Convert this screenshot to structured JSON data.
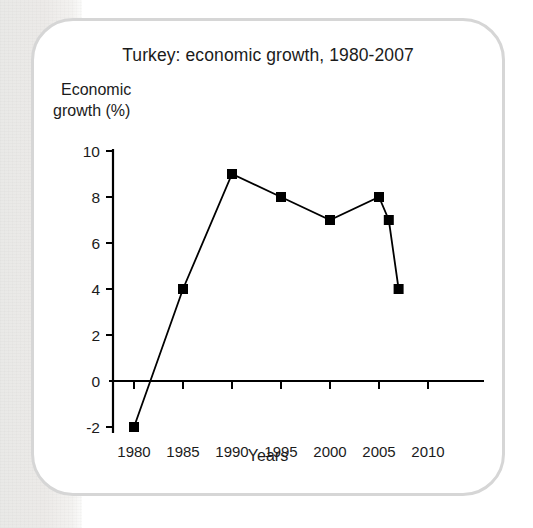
{
  "figure": {
    "title": "Turkey: economic growth, 1980-2007",
    "y_axis_label_line1": "Economic",
    "y_axis_label_line2": "growth (%)",
    "x_axis_label": "Years",
    "card_border_color": "#d6d6d6",
    "series_color": "#000000",
    "background_color": "#ffffff",
    "page_strip_color": "#eceae8"
  },
  "chart_data": {
    "type": "line",
    "title": "Turkey: economic growth, 1980-2007",
    "xlabel": "Years",
    "ylabel": "Economic growth (%)",
    "xlim": [
      1978,
      2011
    ],
    "ylim": [
      -2,
      10
    ],
    "xticks": [
      1980,
      1985,
      1990,
      1995,
      2000,
      2005,
      2010
    ],
    "xtick_labels": [
      "1980",
      "1985",
      "1990",
      "1995",
      "2000",
      "2005",
      "2010"
    ],
    "yticks": [
      -2,
      0,
      2,
      4,
      6,
      8,
      10
    ],
    "ytick_labels": [
      "-2",
      "0",
      "2",
      "4",
      "6",
      "8",
      "10"
    ],
    "grid": false,
    "legend": false,
    "marker": "square",
    "series": [
      {
        "name": "Economic growth (%)",
        "x": [
          1980,
          1985,
          1990,
          1995,
          2000,
          2005,
          2006,
          2007
        ],
        "values": [
          -2,
          4,
          9,
          8,
          7,
          8,
          7,
          4
        ]
      }
    ],
    "points": [
      {
        "year": 1980,
        "value": -2
      },
      {
        "year": 1985,
        "value": 4
      },
      {
        "year": 1990,
        "value": 9
      },
      {
        "year": 1995,
        "value": 8
      },
      {
        "year": 2000,
        "value": 7
      },
      {
        "year": 2005,
        "value": 8
      },
      {
        "year": 2006,
        "value": 7
      },
      {
        "year": 2007,
        "value": 4
      }
    ]
  }
}
